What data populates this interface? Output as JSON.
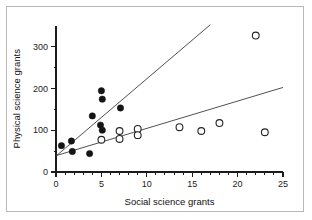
{
  "chart_data": {
    "type": "scatter",
    "title": "",
    "xlabel": "Social science grants",
    "ylabel": "Physical science grants",
    "xlim": [
      0,
      25
    ],
    "ylim": [
      0,
      350
    ],
    "xticks": [
      0,
      5,
      10,
      15,
      20,
      25
    ],
    "xtick_labels": [
      "0",
      "5",
      "10",
      "15",
      "20",
      "25"
    ],
    "yticks": [
      0,
      100,
      200,
      300
    ],
    "ytick_labels": [
      "0",
      "100",
      "200",
      "300"
    ],
    "x_minor_ticks": [
      1,
      2,
      3,
      4,
      6,
      7,
      8,
      9,
      11,
      12,
      13,
      14,
      16,
      17,
      18,
      19,
      21,
      22,
      23,
      24
    ],
    "y_minor_ticks": [
      50,
      150,
      250
    ],
    "grid": false,
    "legend": "none",
    "series": [
      {
        "name": "filled-circles",
        "marker": "filled-circle",
        "color": "#151515",
        "points": [
          [
            0.6,
            63
          ],
          [
            1.7,
            74
          ],
          [
            1.8,
            49
          ],
          [
            3.7,
            44
          ],
          [
            4.0,
            134
          ],
          [
            5.0,
            194
          ],
          [
            5.1,
            174
          ],
          [
            5.1,
            100
          ],
          [
            4.9,
            112
          ],
          [
            7.1,
            153
          ]
        ]
      },
      {
        "name": "open-circles",
        "marker": "open-circle",
        "color": "#ffffff",
        "points": [
          [
            5.0,
            77
          ],
          [
            7.0,
            98
          ],
          [
            7.0,
            79
          ],
          [
            9.0,
            103
          ],
          [
            9.0,
            88
          ],
          [
            13.6,
            107
          ],
          [
            16.0,
            98
          ],
          [
            18.0,
            117
          ],
          [
            22.0,
            326
          ],
          [
            23.0,
            95
          ]
        ]
      }
    ],
    "trend_lines": [
      {
        "name": "steep-regression-line",
        "x_start": 0.0,
        "y_start": 38,
        "x_end": 17.0,
        "y_end": 352,
        "color": "#3c3c3c"
      },
      {
        "name": "shallow-regression-line",
        "x_start": 0.0,
        "y_start": 39,
        "x_end": 25.0,
        "y_end": 202,
        "color": "#3c3c3c"
      }
    ]
  },
  "figure": {
    "background_color": "#ffffff",
    "frame_color": "#b9b9b9",
    "axis_color": "#1b1b1b"
  }
}
